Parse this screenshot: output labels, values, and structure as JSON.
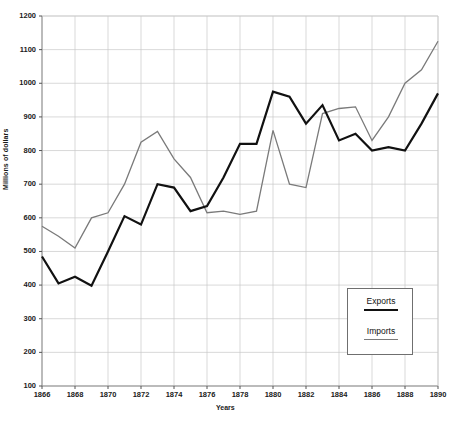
{
  "chart_data": {
    "type": "line",
    "title": "",
    "xlabel": "Years",
    "ylabel": "Millions of dollars",
    "xlim": [
      1866,
      1890
    ],
    "ylim": [
      100,
      1200
    ],
    "grid": true,
    "legend_position": "inside-bottom-right",
    "x": [
      1866,
      1867,
      1868,
      1869,
      1870,
      1871,
      1872,
      1873,
      1874,
      1875,
      1876,
      1877,
      1878,
      1879,
      1880,
      1881,
      1882,
      1883,
      1884,
      1885,
      1886,
      1887,
      1888,
      1889,
      1890
    ],
    "xtick_labels": [
      "1866",
      "1868",
      "1870",
      "1872",
      "1874",
      "1876",
      "1878",
      "1880",
      "1882",
      "1884",
      "1886",
      "1888",
      "1890"
    ],
    "xtick_values": [
      1866,
      1868,
      1870,
      1872,
      1874,
      1876,
      1878,
      1880,
      1882,
      1884,
      1886,
      1888,
      1890
    ],
    "ytick_labels": [
      "100",
      "200",
      "300",
      "400",
      "500",
      "600",
      "700",
      "800",
      "900",
      "1000",
      "1100",
      "1200"
    ],
    "ytick_values": [
      100,
      200,
      300,
      400,
      500,
      600,
      700,
      800,
      900,
      1000,
      1100,
      1200
    ],
    "series": [
      {
        "name": "Exports",
        "color": "#111111",
        "width": 2.2,
        "values": [
          485,
          405,
          425,
          398,
          500,
          605,
          580,
          700,
          690,
          620,
          635,
          720,
          820,
          820,
          975,
          960,
          880,
          935,
          830,
          850,
          800,
          810,
          800,
          880,
          970
        ]
      },
      {
        "name": "Imports",
        "color": "#7a7a7a",
        "width": 1.3,
        "values": [
          575,
          545,
          510,
          600,
          615,
          700,
          825,
          857,
          775,
          720,
          615,
          620,
          610,
          620,
          860,
          700,
          690,
          910,
          925,
          930,
          830,
          900,
          1000,
          1040,
          1125
        ]
      }
    ],
    "legend": [
      {
        "label": "Exports"
      },
      {
        "label": "Imports"
      }
    ]
  }
}
